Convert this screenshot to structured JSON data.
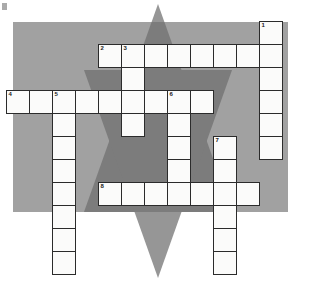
{
  "puzzle": {
    "title": "crossword-grid",
    "cell_size": 23,
    "grid_origin": {
      "x": 6,
      "y": 21
    },
    "colors": {
      "page_background": "#ffffff",
      "panel_background": "#9e9e9e",
      "triangle_light": "#a8a8a8",
      "triangle_dark": "#6e6e6e",
      "cell_fill": "#fbfbfa",
      "cell_border": "#2b2b2b",
      "number_text": "#1a1a1a"
    },
    "panel": {
      "x": 13,
      "y": 22,
      "width": 275,
      "height": 190
    },
    "triangles": [
      {
        "name": "triangle-up",
        "points": "158,4 232,212 84,212",
        "fill": "#6e6e6e"
      },
      {
        "name": "triangle-down",
        "points": "158,278 84,70 232,70",
        "fill": "#6e6e6e"
      }
    ],
    "entries": [
      {
        "number": "1",
        "direction": "down",
        "col": 11,
        "row": 0,
        "length": 6
      },
      {
        "number": "2",
        "direction": "across",
        "col": 4,
        "row": 1,
        "length": 8
      },
      {
        "number": "3",
        "direction": "down",
        "col": 5,
        "row": 1,
        "length": 4
      },
      {
        "number": "4",
        "direction": "across",
        "col": 0,
        "row": 3,
        "length": 9
      },
      {
        "number": "5",
        "direction": "down",
        "col": 2,
        "row": 3,
        "length": 8
      },
      {
        "number": "6",
        "direction": "down",
        "col": 7,
        "row": 3,
        "length": 5
      },
      {
        "number": "7",
        "direction": "down",
        "col": 9,
        "row": 5,
        "length": 6
      },
      {
        "number": "8",
        "direction": "across",
        "col": 4,
        "row": 7,
        "length": 7
      }
    ]
  }
}
